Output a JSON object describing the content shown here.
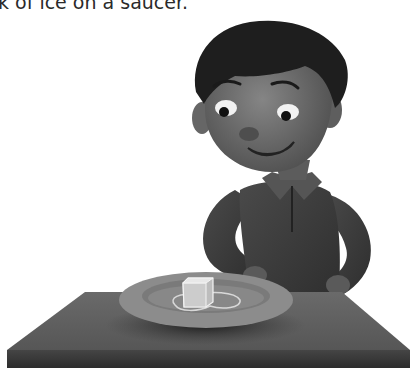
{
  "caption": "k of ice on a saucer.",
  "illustration": {
    "subject": "boy-looking-at-ice-cube",
    "objects": [
      "boy",
      "table",
      "saucer",
      "ice-cube",
      "meltwater-puddle"
    ],
    "colors": {
      "background": "#ffffff",
      "skin": "#6e6e6e",
      "hair": "#1e1e1e",
      "shirt": "#3c3c3c",
      "table_top": "#5e5e5e",
      "table_front": "#3a3a3a",
      "saucer_rim": "#8c8c8c",
      "saucer_inner": "#7a7a7a",
      "ice": "#e8e8e8"
    }
  }
}
